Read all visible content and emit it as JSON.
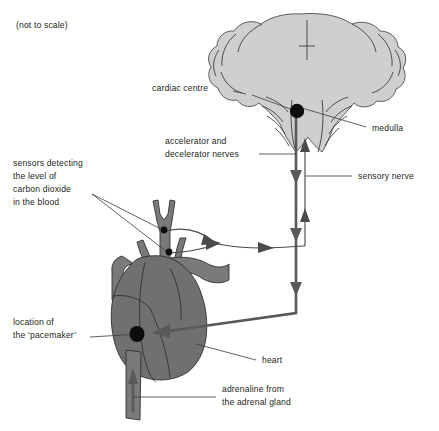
{
  "figure": {
    "scale_note": "(not to scale)",
    "background": "#ffffff",
    "brain_fill": "#cfcfcf",
    "heart_fill": "#707070",
    "vessel_fill": "#7a7a7a",
    "dot_color": "#0d0d0d",
    "line_color": "#4a4a4a",
    "text_color": "#231f20"
  },
  "labels": {
    "cardiac_centre": "cardiac centre",
    "accelerator_line1": "accelerator and",
    "accelerator_line2": "decelerator nerves",
    "sensors_line1": "sensors detecting",
    "sensors_line2": "the level of",
    "sensors_line3": "carbon dioxide",
    "sensors_line4": "in the blood",
    "pacemaker_line1": "location of",
    "pacemaker_line2": "the ‘pacemaker’",
    "medulla": "medulla",
    "sensory_nerve": "sensory nerve",
    "heart": "heart",
    "adrenaline_line1": "adrenaline from",
    "adrenaline_line2": "the adrenal gland"
  },
  "structures": {
    "brain": "ventral-view-brain-with-cerebral-hemispheres-and-brainstem",
    "heart": "heart-with-great-vessels",
    "cardiac_centre_dot": "cardiac-centre-marker",
    "pacemaker_dot": "pacemaker-marker",
    "co2_sensor_dots": 2
  },
  "pathways": {
    "efferent": "accelerator-and-decelerator-nerves-from-cardiac-centre-to-pacemaker",
    "afferent": "sensory-nerve-from-co2-sensors-to-cardiac-centre",
    "adrenaline": "adrenaline-from-adrenal-gland-via-bloodstream-to-heart"
  }
}
